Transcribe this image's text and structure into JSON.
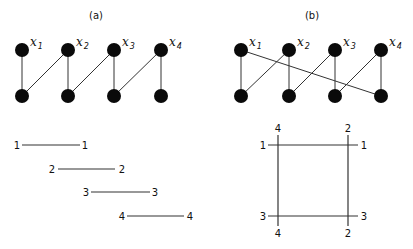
{
  "panels": [
    {
      "title": "(a)",
      "title_pos": [
        96,
        19
      ],
      "node_labels": [
        "x",
        "x",
        "x",
        "x"
      ],
      "node_subscripts": [
        "1",
        "2",
        "3",
        "4"
      ],
      "top_nodes": [
        [
          22,
          50
        ],
        [
          68,
          50
        ],
        [
          114,
          50
        ],
        [
          161,
          50
        ]
      ],
      "bottom_nodes": [
        [
          22,
          96
        ],
        [
          68,
          96
        ],
        [
          114,
          96
        ],
        [
          161,
          96
        ]
      ],
      "edges": [
        [
          0,
          0
        ],
        [
          1,
          0
        ],
        [
          1,
          1
        ],
        [
          2,
          1
        ],
        [
          2,
          2
        ],
        [
          3,
          2
        ],
        [
          3,
          3
        ]
      ],
      "interval_segments": [
        {
          "left_label": "1",
          "right_label": "1",
          "x1": 22,
          "x2": 80,
          "y": 145,
          "lx": 17,
          "rx": 85
        },
        {
          "left_label": "2",
          "right_label": "2",
          "x1": 58,
          "x2": 115,
          "y": 169,
          "lx": 52,
          "rx": 122
        },
        {
          "left_label": "3",
          "right_label": "3",
          "x1": 91,
          "x2": 150,
          "y": 192,
          "lx": 86,
          "rx": 155
        },
        {
          "left_label": "4",
          "right_label": "4",
          "x1": 127,
          "x2": 184,
          "y": 216,
          "lx": 122,
          "rx": 190
        }
      ]
    },
    {
      "title": "(b)",
      "title_pos": [
        312,
        19
      ],
      "node_labels": [
        "x",
        "x",
        "x",
        "x"
      ],
      "node_subscripts": [
        "1",
        "2",
        "3",
        "4"
      ],
      "top_nodes": [
        [
          241,
          50
        ],
        [
          289,
          50
        ],
        [
          335,
          50
        ],
        [
          381,
          50
        ]
      ],
      "bottom_nodes": [
        [
          241,
          96
        ],
        [
          289,
          96
        ],
        [
          335,
          96
        ],
        [
          381,
          96
        ]
      ],
      "edges": [
        [
          0,
          0
        ],
        [
          0,
          3
        ],
        [
          1,
          0
        ],
        [
          1,
          1
        ],
        [
          2,
          1
        ],
        [
          2,
          2
        ],
        [
          3,
          2
        ],
        [
          3,
          3
        ]
      ],
      "square": {
        "left_x": 278,
        "right_x": 348,
        "top_y": 145,
        "bottom_y": 216,
        "top_row_labels": {
          "left": "1",
          "right": "1"
        },
        "bottom_row_labels": {
          "left": "3",
          "right": "3"
        },
        "left_col_labels": {
          "top": "4",
          "bottom": "4"
        },
        "right_col_labels": {
          "top": "2",
          "bottom": "2"
        }
      }
    }
  ],
  "colors": {
    "node": "#0a0a0a",
    "line": "#333333",
    "background": "#ffffff"
  }
}
